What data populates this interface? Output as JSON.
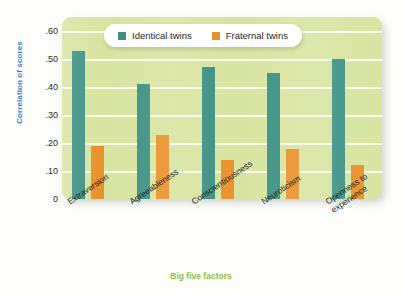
{
  "chart_data": {
    "type": "bar",
    "title": "",
    "xlabel": "Big five factors",
    "ylabel": "Correlation of scores",
    "ylim": [
      0,
      0.65
    ],
    "grid": true,
    "legend_position": "top-center",
    "categories": [
      "Extraversion",
      "Agreeableness",
      "Conscientiousness",
      "Neuroticism",
      "Openness to experience"
    ],
    "category_lines": [
      [
        "Extraversion"
      ],
      [
        "Agreeableness"
      ],
      [
        "Conscientiousness"
      ],
      [
        "Neuroticism"
      ],
      [
        "Openness to",
        "experience"
      ]
    ],
    "ytick_labels": [
      ".60",
      ".50",
      ".40",
      ".30",
      ".20",
      ".10",
      "0"
    ],
    "ytick_values": [
      0.6,
      0.5,
      0.4,
      0.3,
      0.2,
      0.1,
      0
    ],
    "series": [
      {
        "name": "Identical twins",
        "color": "#3d9184",
        "values": [
          0.53,
          0.41,
          0.47,
          0.45,
          0.5
        ]
      },
      {
        "name": "Fraternal twins",
        "color": "#e8922c",
        "values": [
          0.19,
          0.23,
          0.14,
          0.18,
          0.12
        ]
      }
    ]
  },
  "legend": {
    "entries": [
      {
        "label": "Identical twins"
      },
      {
        "label": "Fraternal twins"
      }
    ]
  },
  "axes": {
    "y_title": "Correlation of scores",
    "x_title": "Big five factors"
  },
  "colors": {
    "panel_background": "#d8e4a0",
    "gridline": "#fbfcf2",
    "identical_twins": "#3d9184",
    "fraternal_twins": "#e8922c",
    "y_axis_title": "#3b7fc4",
    "x_axis_title": "#8cbf4a"
  }
}
